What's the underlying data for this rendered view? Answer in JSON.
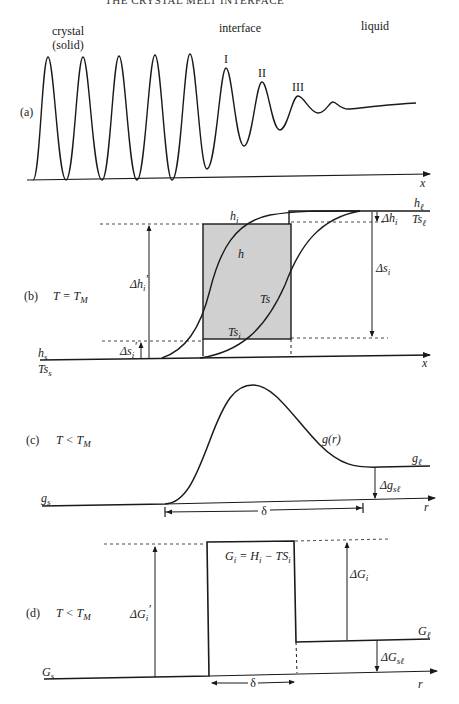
{
  "header": {
    "running_title": "THE CRYSTAL MELT INTERFACE"
  },
  "panel_a": {
    "tag": "(a)",
    "region_labels": {
      "crystal_line1": "crystal",
      "crystal_line2": "(solid)",
      "interface": "interface",
      "liquid": "liquid"
    },
    "peak_labels": [
      "I",
      "II",
      "III"
    ],
    "x_axis": "x"
  },
  "panel_b": {
    "tag": "(b)",
    "condition": "T = T",
    "condition_sub": "M",
    "labels": {
      "h_i": "h",
      "h_i_sub": "i",
      "h": "h",
      "Ts": "Ts",
      "Ts_i": "Ts",
      "Ts_i_sub": "i",
      "h_s": "h",
      "h_s_sub": "s",
      "Ts_s": "Ts",
      "Ts_s_sub": "s",
      "h_l": "h",
      "h_l_sub": "ℓ",
      "Ts_l": "Ts",
      "Ts_l_sub": "ℓ",
      "delta_h_i_prime": "Δh",
      "delta_h_i_prime_sub": "i",
      "delta_h_i_prime_mark": "′",
      "delta_s_i_prime": "Δs",
      "delta_s_i_prime_sub": "i",
      "delta_s_i_prime_mark": "′",
      "delta_h_i": "Δh",
      "delta_h_i_sub": "i",
      "delta_s_i": "Δs",
      "delta_s_i_sub": "i"
    },
    "x_axis": "x",
    "shade_color": "#cfcfcf"
  },
  "panel_c": {
    "tag": "(c)",
    "condition": "T < T",
    "condition_sub": "M",
    "labels": {
      "g_r": "g(r)",
      "g_s": "g",
      "g_s_sub": "s",
      "g_l": "g",
      "g_l_sub": "ℓ",
      "delta_g_sl": "Δg",
      "delta_g_sl_sub": "sℓ",
      "delta": "δ"
    },
    "x_axis": "r"
  },
  "panel_d": {
    "tag": "(d)",
    "condition": "T < T",
    "condition_sub": "M",
    "labels": {
      "G_i_eq": "G",
      "G_i_eq_sub": "i",
      "G_i_eq_rest": " = H",
      "G_i_eq_sub2": "i",
      "G_i_eq_rest2": " − TS",
      "G_i_eq_sub3": "i",
      "G_s": "G",
      "G_s_sub": "s",
      "G_l": "G",
      "G_l_sub": "ℓ",
      "delta_G_i_prime": "ΔG",
      "delta_G_i_prime_sub": "i",
      "delta_G_i_prime_mark": "′",
      "delta_G_i": "ΔG",
      "delta_G_i_sub": "i",
      "delta_G_sl": "ΔG",
      "delta_G_sl_sub": "sℓ",
      "delta": "δ"
    },
    "x_axis": "r"
  }
}
